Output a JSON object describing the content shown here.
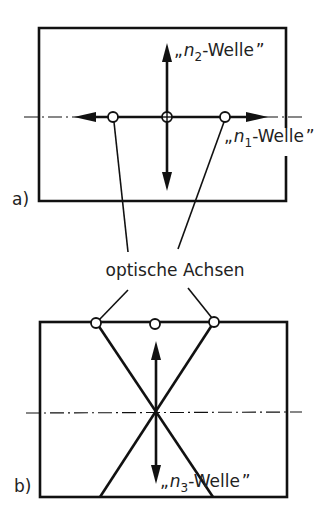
{
  "figure": {
    "label_a": "a)",
    "label_b": "b)",
    "center_label": "optische Achsen"
  },
  "panel_a": {
    "wave_n2": {
      "quote_open": "„",
      "symbol": "n",
      "subscript": "2",
      "suffix": "-Welle",
      "quote_close": "”"
    },
    "wave_n1": {
      "quote_open": "„",
      "symbol": "n",
      "subscript": "1",
      "suffix": "-Welle",
      "quote_close": "”"
    }
  },
  "panel_b": {
    "wave_n3": {
      "quote_open": "„",
      "symbol": "n",
      "subscript": "3",
      "suffix": "-Welle",
      "quote_close": "”"
    }
  },
  "colors": {
    "ink": "#111111",
    "background": "#ffffff"
  }
}
